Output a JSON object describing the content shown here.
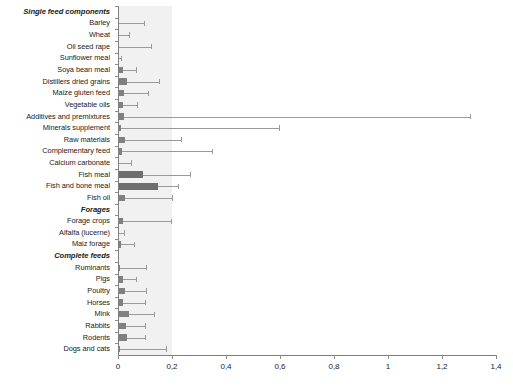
{
  "chart_data": {
    "type": "bar",
    "orientation": "horizontal",
    "title": "",
    "xlabel": "",
    "ylabel": "",
    "xlim": [
      0,
      1.4
    ],
    "xticks": [
      0,
      0.2,
      0.4,
      0.6,
      0.8,
      1.0,
      1.2,
      1.4
    ],
    "xtick_labels": [
      "0",
      "0,2",
      "0,4",
      "0,6",
      "0,8",
      "1",
      "1,2",
      "1,4"
    ],
    "grid": false,
    "legend": null,
    "decimal_separator": ",",
    "bar_color": "#808080",
    "error_color": "#9a9a9a",
    "axis_color": "#7f7f7f",
    "band_color": "#f1f1f1",
    "categories": [
      {
        "label": "Single feed components",
        "group": true,
        "value": null,
        "error": null
      },
      {
        "label": "Barley",
        "group": false,
        "value": 0.005,
        "error": 0.095
      },
      {
        "label": "Wheat",
        "group": false,
        "value": 0.004,
        "error": 0.04
      },
      {
        "label": "Oil seed rape",
        "group": false,
        "value": 0.005,
        "error": 0.122
      },
      {
        "label": "Sunflower meal",
        "group": false,
        "value": 0.003,
        "error": 0.012
      },
      {
        "label": "Soya bean meal",
        "group": false,
        "value": 0.018,
        "error": 0.066
      },
      {
        "label": "Distillers dried grains",
        "group": false,
        "value": 0.032,
        "error": 0.152
      },
      {
        "label": "Maize gluten feed",
        "group": false,
        "value": 0.022,
        "error": 0.112
      },
      {
        "label": "Vegetable oils",
        "group": false,
        "value": 0.018,
        "error": 0.072
      },
      {
        "label": "Additives and premixtures",
        "group": false,
        "value": 0.022,
        "error": 1.305
      },
      {
        "label": "Minerals supplement",
        "group": false,
        "value": 0.01,
        "error": 0.596
      },
      {
        "label": "Raw materials",
        "group": false,
        "value": 0.025,
        "error": 0.233
      },
      {
        "label": "Complementary feed",
        "group": false,
        "value": 0.015,
        "error": 0.348
      },
      {
        "label": "Calcium carbonate",
        "group": false,
        "value": 0.004,
        "error": 0.047
      },
      {
        "label": "Fish meal",
        "group": false,
        "value": 0.092,
        "error": 0.265
      },
      {
        "label": "Fish and bone meal",
        "group": false,
        "value": 0.148,
        "error": 0.223
      },
      {
        "label": "Fish oil",
        "group": false,
        "value": 0.026,
        "error": 0.2
      },
      {
        "label": "Forages",
        "group": true,
        "value": null,
        "error": null
      },
      {
        "label": "Forage crops",
        "group": false,
        "value": 0.018,
        "error": 0.197
      },
      {
        "label": "Alfalfa (lucerne)",
        "group": false,
        "value": 0.004,
        "error": 0.022
      },
      {
        "label": "Maiz forage",
        "group": false,
        "value": 0.01,
        "error": 0.058
      },
      {
        "label": "Complete feeds",
        "group": true,
        "value": null,
        "error": null
      },
      {
        "label": "Ruminants",
        "group": false,
        "value": 0.006,
        "error": 0.103
      },
      {
        "label": "Pigs",
        "group": false,
        "value": 0.018,
        "error": 0.068
      },
      {
        "label": "Poultry",
        "group": false,
        "value": 0.027,
        "error": 0.104
      },
      {
        "label": "Horses",
        "group": false,
        "value": 0.017,
        "error": 0.101
      },
      {
        "label": "Mink",
        "group": false,
        "value": 0.039,
        "error": 0.134
      },
      {
        "label": "Rabbits",
        "group": false,
        "value": 0.029,
        "error": 0.099
      },
      {
        "label": "Rodents",
        "group": false,
        "value": 0.034,
        "error": 0.101
      },
      {
        "label": "Dogs and cats",
        "group": false,
        "value": 0.009,
        "error": 0.178
      }
    ]
  }
}
